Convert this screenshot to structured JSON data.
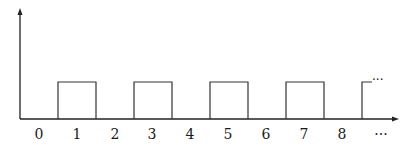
{
  "chart_data": {
    "type": "line",
    "title": "",
    "subtitle": "",
    "xlabel": "",
    "ylabel": "",
    "grid": false,
    "legend": null,
    "x_tick_labels": [
      "0",
      "1",
      "2",
      "3",
      "4",
      "5",
      "6",
      "7",
      "8",
      "···"
    ],
    "x": [
      0,
      0.5,
      0.5,
      1.5,
      1.5,
      2.5,
      2.5,
      3.5,
      3.5,
      4.5,
      4.5,
      5.5,
      5.5,
      6.5,
      6.5,
      7.5,
      7.5,
      8.5,
      8.5,
      8.9
    ],
    "y": [
      0,
      0,
      1,
      1,
      0,
      0,
      1,
      1,
      0,
      0,
      1,
      1,
      0,
      0,
      1,
      1,
      0,
      0,
      1,
      1
    ],
    "pulses": [
      {
        "center": 1,
        "start": 0.5,
        "end": 1.5,
        "height": 1
      },
      {
        "center": 3,
        "start": 2.5,
        "end": 3.5,
        "height": 1
      },
      {
        "center": 5,
        "start": 4.5,
        "end": 5.5,
        "height": 1
      },
      {
        "center": 7,
        "start": 6.5,
        "end": 7.5,
        "height": 1
      },
      {
        "center": 9,
        "start": 8.5,
        "end": null,
        "height": 1,
        "continues": true
      }
    ],
    "continuation_marker": "···",
    "xlim": [
      -0.5,
      9.4
    ],
    "ylim": [
      0,
      2.9
    ]
  },
  "labels": {
    "ticks": [
      "0",
      "1",
      "2",
      "3",
      "4",
      "5",
      "6",
      "7",
      "8",
      "···"
    ],
    "continuation": "···"
  }
}
